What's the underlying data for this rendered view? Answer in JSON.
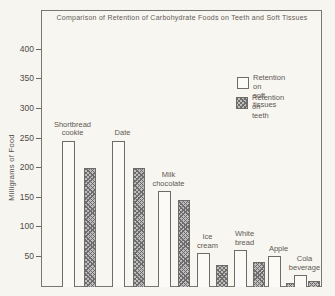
{
  "title": "Comparison of Retention of Carbohydrate Foods on Teeth and Soft Tissues",
  "y_axis": {
    "label": "Milligrams of Food",
    "ticks": [
      400,
      350,
      300,
      250,
      200,
      150,
      100,
      50
    ]
  },
  "legend": {
    "items": [
      {
        "series": "soft_tissues",
        "swatch": "open",
        "lines": [
          "Retention on",
          "soft tissues"
        ]
      },
      {
        "series": "teeth",
        "swatch": "hatched",
        "lines": [
          "Retention on",
          "teeth"
        ]
      }
    ]
  },
  "chart_data": {
    "type": "bar",
    "title": "Comparison of Retention of Carbohydrate Foods on Teeth and Soft Tissues",
    "xlabel": "",
    "ylabel": "Milligrams of Food",
    "ylim": [
      0,
      430
    ],
    "yticks": [
      50,
      100,
      150,
      200,
      250,
      300,
      350,
      400
    ],
    "grid": false,
    "legend_position": "upper right",
    "categories": [
      "Shortbread cookie",
      "Date",
      "Milk chocolate",
      "Ice cream",
      "White bread",
      "Apple",
      "Cola beverage"
    ],
    "category_lines": [
      [
        "Shortbread",
        "cookie"
      ],
      [
        "Date"
      ],
      [
        "Milk",
        "chocolate"
      ],
      [
        "Ice",
        "cream"
      ],
      [
        "White",
        "bread"
      ],
      [
        "Apple"
      ],
      [
        "Cola",
        "beverage"
      ]
    ],
    "series": [
      {
        "name": "Retention on soft tissues",
        "style": "open",
        "values": [
          245,
          245,
          160,
          55,
          60,
          50,
          18
        ]
      },
      {
        "name": "Retention on teeth",
        "style": "hatched",
        "values": [
          200,
          200,
          145,
          35,
          40,
          5,
          8
        ]
      }
    ]
  },
  "colors": {
    "background": "#f7f5f0",
    "frame": "#7a7671",
    "axis_text": "#4f4b47",
    "bar_outline": "#6f6b66",
    "open_fill": "#fbfaf6",
    "hatch_fill": "#bdbdbd",
    "hatch_line": "#6d6d6d",
    "label_text": "#5d5954"
  }
}
